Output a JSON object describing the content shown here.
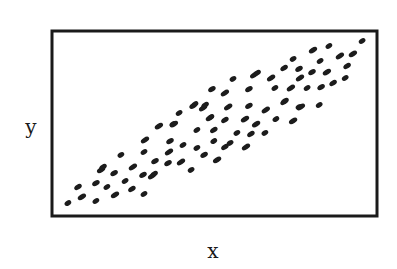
{
  "chart_data": {
    "type": "scatter",
    "title": "",
    "xlabel": "x",
    "ylabel": "y",
    "xlim": [
      0,
      100
    ],
    "ylim": [
      0,
      100
    ],
    "grid": false,
    "legend": null,
    "ticks": {
      "x": [],
      "y": []
    },
    "series": [
      {
        "name": "points",
        "marker": "elongated dot",
        "color": "#1c1c1c",
        "points": [
          [
            4.9,
            7.0
          ],
          [
            8.0,
            15.7
          ],
          [
            9.2,
            10.3
          ],
          [
            13.5,
            8.1
          ],
          [
            13.5,
            17.8
          ],
          [
            15.1,
            24.9
          ],
          [
            16.9,
            15.7
          ],
          [
            19.1,
            23.2
          ],
          [
            19.4,
            11.4
          ],
          [
            22.5,
            18.9
          ],
          [
            24.6,
            14.6
          ],
          [
            24.9,
            26.5
          ],
          [
            28.3,
            11.9
          ],
          [
            28.0,
            22.2
          ],
          [
            30.8,
            21.6
          ],
          [
            21.2,
            33.0
          ],
          [
            15.7,
            26.5
          ],
          [
            28.6,
            41.1
          ],
          [
            28.3,
            34.6
          ],
          [
            31.7,
            29.7
          ],
          [
            32.9,
            48.6
          ],
          [
            37.2,
            49.7
          ],
          [
            36.3,
            40.5
          ],
          [
            36.0,
            34.6
          ],
          [
            40.3,
            38.4
          ],
          [
            35.7,
            28.6
          ],
          [
            39.7,
            29.2
          ],
          [
            42.8,
            24.9
          ],
          [
            31.4,
            22.7
          ],
          [
            37.5,
            49.7
          ],
          [
            39.1,
            55.7
          ],
          [
            43.4,
            59.5
          ],
          [
            46.5,
            58.4
          ],
          [
            44.6,
            46.5
          ],
          [
            49.8,
            46.5
          ],
          [
            48.6,
            53.0
          ],
          [
            44.6,
            36.8
          ],
          [
            46.8,
            33.0
          ],
          [
            50.8,
            30.3
          ],
          [
            49.8,
            40.5
          ],
          [
            53.2,
            37.3
          ],
          [
            59.7,
            37.3
          ],
          [
            54.8,
            39.5
          ],
          [
            49.2,
            68.6
          ],
          [
            53.2,
            66.5
          ],
          [
            55.7,
            74.1
          ],
          [
            60.6,
            68.6
          ],
          [
            62.2,
            76.2
          ],
          [
            44.0,
            60.5
          ],
          [
            47.1,
            60.0
          ],
          [
            54.2,
            58.9
          ],
          [
            48.9,
            53.5
          ],
          [
            53.2,
            51.9
          ],
          [
            59.4,
            52.4
          ],
          [
            56.9,
            44.9
          ],
          [
            61.2,
            44.3
          ],
          [
            62.8,
            49.7
          ],
          [
            65.5,
            44.9
          ],
          [
            60.6,
            59.5
          ],
          [
            65.8,
            57.3
          ],
          [
            68.9,
            52.4
          ],
          [
            71.4,
            61.6
          ],
          [
            74.2,
            51.4
          ],
          [
            76.0,
            59.0
          ],
          [
            63.1,
            77.3
          ],
          [
            67.4,
            74.6
          ],
          [
            68.6,
            69.2
          ],
          [
            71.4,
            80.0
          ],
          [
            73.5,
            69.2
          ],
          [
            74.2,
            84.9
          ],
          [
            76.0,
            79.5
          ],
          [
            76.3,
            74.6
          ],
          [
            78.5,
            69.2
          ],
          [
            80.0,
            77.8
          ],
          [
            80.3,
            89.7
          ],
          [
            82.5,
            83.8
          ],
          [
            82.8,
            69.7
          ],
          [
            84.6,
            77.8
          ],
          [
            85.2,
            91.9
          ],
          [
            86.5,
            71.9
          ],
          [
            88.6,
            86.5
          ],
          [
            90.2,
            74.6
          ],
          [
            90.8,
            81.1
          ],
          [
            92.6,
            87.6
          ],
          [
            95.4,
            94.6
          ],
          [
            71.7,
            62.2
          ],
          [
            76.6,
            58.9
          ],
          [
            82.2,
            60.0
          ]
        ]
      }
    ]
  },
  "labels": {
    "x_axis": "x",
    "y_axis": "y"
  }
}
